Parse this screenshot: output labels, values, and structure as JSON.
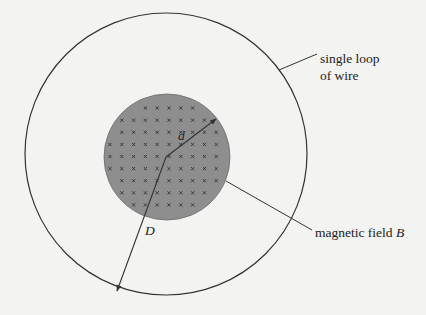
{
  "diagram": {
    "background": "#f3f3f2",
    "line_color": "#333333",
    "outer_loop": {
      "cx": 166,
      "cy": 154,
      "r": 141,
      "label_line1": "single loop",
      "label_line2": "of wire"
    },
    "field_region": {
      "cx": 167,
      "cy": 157,
      "r": 63,
      "fill": "#8e8e8e",
      "mark": "×",
      "mark_color": "#333333",
      "grid_x0": 110,
      "grid_y0": 96,
      "grid_step_x": 11.8,
      "grid_step_y": 12.1,
      "cols": 11,
      "rows": 11
    },
    "field_label": {
      "text": "magnetic field ",
      "symbol": "B"
    },
    "radius_d": {
      "label": "d"
    },
    "radius_D": {
      "label": "D"
    }
  }
}
